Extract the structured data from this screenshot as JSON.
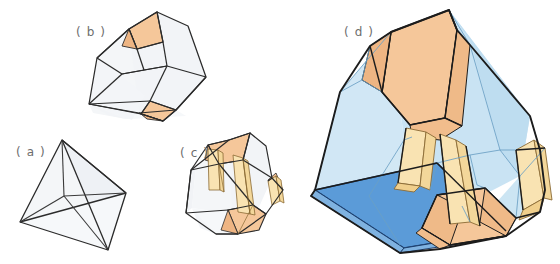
{
  "figure": {
    "background_color": "#ffffff",
    "panels": [
      {
        "id": "a",
        "label": "( a )",
        "label_x": 16,
        "label_y": 156,
        "name": "tetrahedron",
        "fill": "#f2f4f7",
        "stroke": "#2b2b2b"
      },
      {
        "id": "b",
        "label": "( b )",
        "label_x": 76,
        "label_y": 36,
        "name": "vertex-truncated-tetrahedron",
        "fill": "#f2f4f7",
        "accent_fill": "#f5c79a",
        "stroke": "#2b2b2b"
      },
      {
        "id": "c",
        "label": "( c )",
        "label_x": 180,
        "label_y": 157,
        "name": "vertex-and-edge-truncated-tetrahedron",
        "fill": "#f2f4f7",
        "accent_fill": "#f5c79a",
        "band_fill": "#f9e3b2",
        "stroke": "#2b2b2b"
      },
      {
        "id": "d",
        "label": "( d )",
        "label_x": 344,
        "label_y": 36,
        "name": "large-transparent-truncated-solid",
        "glass_fill": "#bfdef0",
        "deep_fill": "#5b9bd8",
        "accent_fill": "#f5c79a",
        "band_fill": "#f9e3b2",
        "stroke": "#1c1c1c",
        "inner_stroke": "#6a9fc4"
      }
    ],
    "colors": {
      "pale_face": "#f2f4f7",
      "orange_face": "#f5c79a",
      "yellow_band": "#f9e3b2",
      "light_blue": "#bfdef0",
      "deep_blue": "#5b9bd8",
      "outline_dark": "#2b2b2b",
      "outline_thin": "#6a9fc4",
      "label_gray": "#6d6d6d"
    }
  }
}
